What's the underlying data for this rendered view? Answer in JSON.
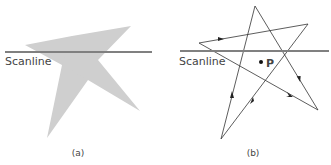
{
  "figure": {
    "panel_a": {
      "caption": "(a)",
      "scanline_label": "Scanline",
      "star_fill": "#cfcfcf",
      "scanline_color": "#808080"
    },
    "panel_b": {
      "caption": "(b)",
      "scanline_label": "Scanline",
      "point_label": "P",
      "edge_color": "#333333",
      "scanline_color": "#808080"
    }
  }
}
